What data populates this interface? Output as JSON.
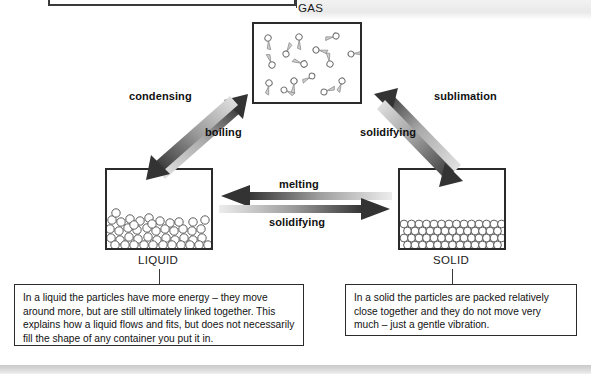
{
  "diagram": {
    "states": [
      {
        "id": "gas",
        "label": "GAS"
      },
      {
        "id": "liquid",
        "label": "LIQUID"
      },
      {
        "id": "solid",
        "label": "SOLID"
      }
    ],
    "transitions": [
      {
        "id": "condensing",
        "label": "condensing",
        "from": "gas",
        "to": "liquid"
      },
      {
        "id": "boiling",
        "label": "boiling",
        "from": "liquid",
        "to": "gas"
      },
      {
        "id": "sublimation",
        "label": "sublimation",
        "from": "solid",
        "to": "gas"
      },
      {
        "id": "solidifying-gas",
        "label": "solidifying",
        "from": "gas",
        "to": "solid"
      },
      {
        "id": "melting",
        "label": "melting",
        "from": "solid",
        "to": "liquid"
      },
      {
        "id": "solidifying-liq",
        "label": "solidifying",
        "from": "liquid",
        "to": "solid"
      }
    ],
    "descriptions": {
      "liquid": "In a liquid the particles have more energy – they move around more, but are still ultimately linked together. This explains how a liquid flows and fits, but does not necessarily fill the shape of any container you put it in.",
      "solid": "In a solid the particles are packed relatively close together and they do not move very much – just a gentle vibration."
    },
    "colors": {
      "outline": "#2b2b2b",
      "arrow_dark": "#3c3c3c",
      "arrow_light": "#d8d8d8",
      "particle_stroke": "#6b6b6b",
      "text": "#121212",
      "band": "#d4d4d4"
    },
    "particle_counts": {
      "gas": 15,
      "liquid": 46,
      "solid": 60
    }
  }
}
